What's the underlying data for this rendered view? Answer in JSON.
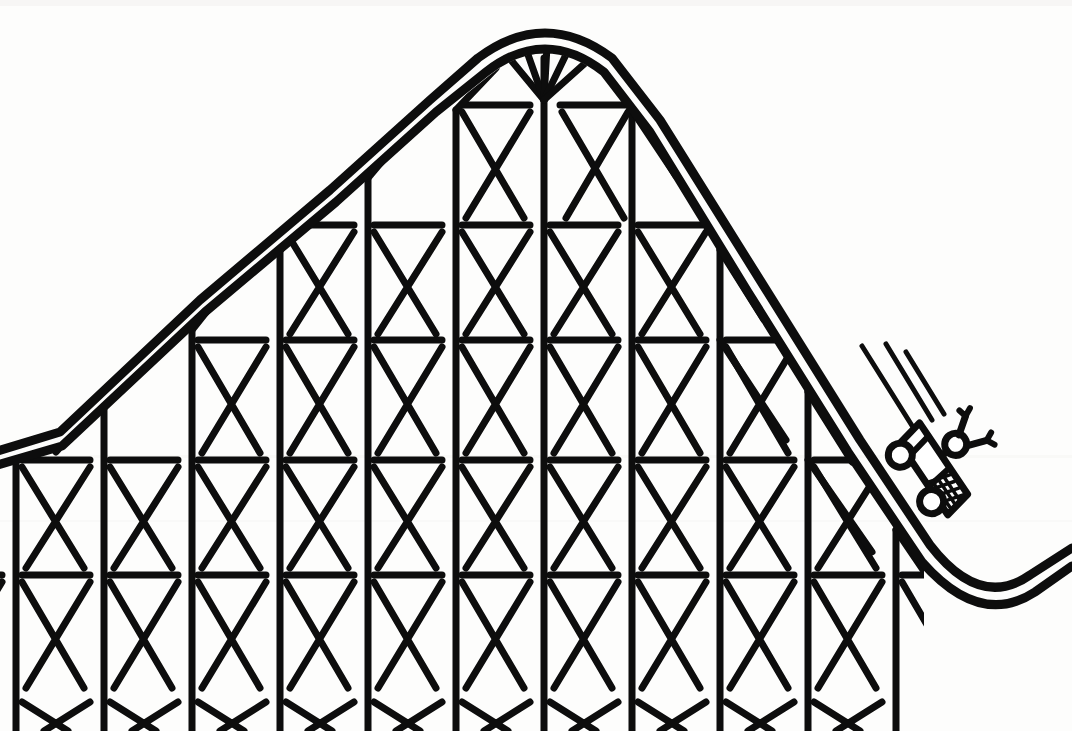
{
  "meta": {
    "medium": "black ink line drawing on white paper",
    "width": 1072,
    "height": 731,
    "ink_color": "#0d0d0d",
    "paper_color": "#fdfdfc"
  },
  "chart_data": {
    "type": "diagram",
    "elements": [
      "track-double-line",
      "summit-crest",
      "truss-lattice",
      "coaster-car",
      "rider",
      "speed-lines",
      "valley-curve"
    ],
    "annotations": [],
    "legend": []
  },
  "scene": {
    "summit": {
      "label": "summit",
      "x": 545,
      "y": 22
    },
    "track": {
      "label": "track",
      "style": "double parallel line",
      "outer_path": "M -6,452 L 60,432 L 200,300 L 330,190 L 430,100 L 478,58 Q 545,8 612,58 L 660,120 L 760,280 L 860,440 L 930,545 Q 980,610 1030,575 L 1072,548",
      "inner_path": "M -6,466 L 62,446 L 205,312 L 336,202 L 436,112 L 486,72 Q 545,26 604,72 L 650,132 L 748,292 L 848,452 L 922,562 Q 980,628 1035,592 L 1072,566",
      "stroke_width": 9
    },
    "lattice": {
      "label": "wooden trestle lattice",
      "beam_rows_y": [
        105,
        225,
        340,
        460,
        575,
        695
      ],
      "post_spacing_x": 88,
      "post_origin_x": 16,
      "member_stroke_width": 7,
      "members": [
        "vertical-post",
        "horizontal-beam",
        "x-brace"
      ]
    },
    "car": {
      "label": "coaster car",
      "x": 932,
      "y": 470,
      "rider": "rider with raised arms",
      "wheels": 2
    },
    "speed_lines": {
      "label": "speed lines",
      "count": 3,
      "from_x": 862,
      "from_y": 348
    },
    "valley": {
      "label": "valley",
      "x": 985,
      "y": 595
    }
  }
}
